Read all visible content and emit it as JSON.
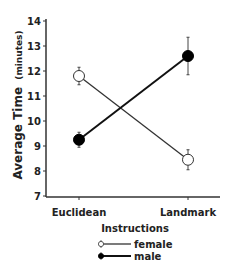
{
  "chart_data": {
    "type": "line",
    "title": "",
    "xlabel": "Instructions",
    "ylabel": "Average Time",
    "ylabel_unit": "(minutes)",
    "categories": [
      "Euclidean",
      "Landmark"
    ],
    "ylim": [
      7,
      14
    ],
    "yticks": [
      7,
      8,
      9,
      10,
      11,
      12,
      13,
      14
    ],
    "grid": false,
    "legend_position": "bottom",
    "series": [
      {
        "name": "female",
        "marker": "open-circle",
        "values": [
          11.8,
          8.45
        ],
        "errors": [
          0.35,
          0.4
        ]
      },
      {
        "name": "male",
        "marker": "filled-circle",
        "values": [
          9.25,
          12.6
        ],
        "errors": [
          0.3,
          0.75
        ]
      }
    ]
  },
  "colors": {
    "axis": "#333333",
    "female_line": "#333333",
    "male_line": "#111111",
    "female_fill": "#ffffff",
    "male_fill": "#000000"
  }
}
